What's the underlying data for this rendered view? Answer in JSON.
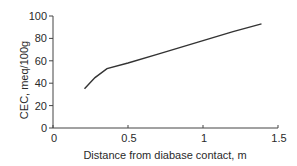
{
  "chart_data": {
    "type": "line",
    "title": "",
    "xlabel": "Distance from diabase contact, m",
    "ylabel": "CEC, meq/100g",
    "xlim": [
      0,
      1.5
    ],
    "ylim": [
      0,
      100
    ],
    "x_ticks": [
      0,
      0.5,
      1,
      1.5
    ],
    "x_tick_labels": [
      "0",
      "0.5",
      "1",
      "1.5"
    ],
    "y_ticks": [
      0,
      20,
      40,
      60,
      80,
      100
    ],
    "y_tick_labels": [
      "0",
      "20",
      "40",
      "60",
      "80",
      "100"
    ],
    "grid": false,
    "legend": null,
    "series": [
      {
        "name": "CEC",
        "x": [
          0.21,
          0.28,
          0.36,
          0.5,
          0.7,
          1.0,
          1.2,
          1.39
        ],
        "y": [
          35,
          45,
          53,
          58,
          66,
          78,
          86,
          93
        ]
      }
    ],
    "line_color": "#333333"
  }
}
